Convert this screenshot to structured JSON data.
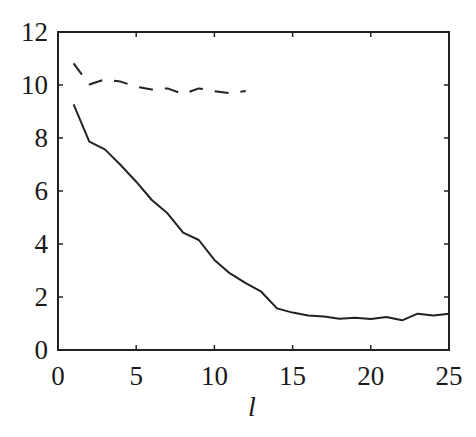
{
  "chart_data": {
    "type": "line",
    "title": "",
    "xlabel": "l",
    "ylabel": "",
    "xlim": [
      0,
      25
    ],
    "ylim": [
      0,
      12
    ],
    "xticks": [
      0,
      5,
      10,
      15,
      20,
      25
    ],
    "yticks": [
      0,
      2,
      4,
      6,
      8,
      10,
      12
    ],
    "grid": false,
    "legend": null,
    "series": [
      {
        "name": "dashed",
        "style": "dashed",
        "color": "#222222",
        "x": [
          1,
          2,
          3,
          4,
          5,
          6,
          7,
          8,
          9,
          10,
          11,
          12
        ],
        "values": [
          10.82,
          10.02,
          10.21,
          10.13,
          9.94,
          9.83,
          9.87,
          9.66,
          9.87,
          9.77,
          9.69,
          9.77
        ]
      },
      {
        "name": "solid",
        "style": "solid",
        "color": "#222222",
        "x": [
          1,
          2,
          3,
          4,
          5,
          6,
          7,
          8,
          9,
          10,
          11,
          12,
          13,
          14,
          15,
          16,
          17,
          18,
          19,
          20,
          21,
          22,
          23,
          24,
          25
        ],
        "values": [
          9.27,
          7.86,
          7.57,
          6.98,
          6.35,
          5.66,
          5.16,
          4.43,
          4.15,
          3.4,
          2.89,
          2.52,
          2.2,
          1.57,
          1.41,
          1.3,
          1.26,
          1.18,
          1.22,
          1.17,
          1.25,
          1.12,
          1.37,
          1.3,
          1.37
        ]
      }
    ]
  }
}
